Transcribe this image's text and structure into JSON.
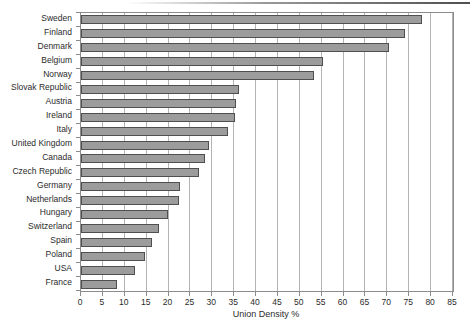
{
  "chart_data": {
    "type": "bar",
    "orientation": "horizontal",
    "title": "",
    "xlabel": "Union Density %",
    "ylabel": "",
    "xlim": [
      0,
      85
    ],
    "xticks": [
      0,
      5,
      10,
      15,
      20,
      25,
      30,
      35,
      40,
      45,
      50,
      55,
      60,
      65,
      70,
      75,
      80,
      85
    ],
    "grid": "vertical-major",
    "legend": "none",
    "categories": [
      "Sweden",
      "Finland",
      "Denmark",
      "Belgium",
      "Norway",
      "Slovak Republic",
      "Austria",
      "Ireland",
      "Italy",
      "United Kingdom",
      "Canada",
      "Czech Republic",
      "Germany",
      "Netherlands",
      "Hungary",
      "Switzerland",
      "Spain",
      "Poland",
      "USA",
      "France"
    ],
    "values": [
      78.0,
      74.1,
      70.4,
      55.4,
      53.3,
      36.1,
      35.4,
      35.3,
      33.7,
      29.3,
      28.4,
      27.0,
      22.6,
      22.3,
      19.9,
      17.8,
      16.3,
      14.7,
      12.4,
      8.3
    ],
    "colors": {
      "bar_fill": "#9c9c9c",
      "bar_border": "#4f4f4f",
      "gridline": "#b3b3b3",
      "axis": "#8c8c8c",
      "text": "#2b2b2b"
    }
  }
}
